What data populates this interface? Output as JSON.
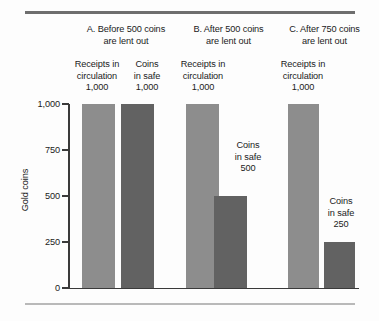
{
  "figure": {
    "y_axis_title": "Gold coins",
    "y_ticks": [
      "1,000",
      "750",
      "500",
      "250",
      "0"
    ]
  },
  "groups": [
    {
      "title_line1": "A. Before 500 coins",
      "title_line2": "are lent out",
      "bars": [
        {
          "label_line1": "Receipts in",
          "label_line2": "circulation",
          "value_label": "1,000",
          "value": 1000,
          "series": "receipts"
        },
        {
          "label_line1": "Coins",
          "label_line2": "in safe",
          "value_label": "1,000",
          "value": 1000,
          "series": "coins"
        }
      ]
    },
    {
      "title_line1": "B. After 500 coins",
      "title_line2": "are lent out",
      "bars": [
        {
          "label_line1": "Receipts in",
          "label_line2": "circulation",
          "value_label": "1,000",
          "value": 1000,
          "series": "receipts"
        },
        {
          "label_line1": "Coins",
          "label_line2": "in safe",
          "value_label": "500",
          "value": 500,
          "series": "coins"
        }
      ]
    },
    {
      "title_line1": "C. After 750 coins",
      "title_line2": "are lent out",
      "bars": [
        {
          "label_line1": "Receipts in",
          "label_line2": "circulation",
          "value_label": "1,000",
          "value": 1000,
          "series": "receipts"
        },
        {
          "label_line1": "Coins",
          "label_line2": "in safe",
          "value_label": "250",
          "value": 250,
          "series": "coins"
        }
      ]
    }
  ],
  "colors": {
    "receipts_bar": "#8d8d8d",
    "coins_bar": "#626262",
    "axis": "#3a3a3a",
    "rule_top": "#6e6e6e",
    "rule_bottom": "#b9b9b9",
    "background": "#fdfdfd",
    "text": "#1b1b1b"
  },
  "chart_data": {
    "type": "bar",
    "title": "",
    "xlabel": "",
    "ylabel": "Gold coins",
    "ylim": [
      0,
      1000
    ],
    "yticks": [
      0,
      250,
      500,
      750,
      1000
    ],
    "ytick_labels": [
      "0",
      "250",
      "500",
      "750",
      "1,000"
    ],
    "grid": false,
    "legend": "none",
    "panels": [
      {
        "name": "A. Before 500 coins are lent out",
        "categories": [
          "Receipts in circulation",
          "Coins in safe"
        ],
        "values": [
          1000,
          1000
        ],
        "data_labels": [
          "1,000",
          "1,000"
        ]
      },
      {
        "name": "B. After 500 coins are lent out",
        "categories": [
          "Receipts in circulation",
          "Coins in safe"
        ],
        "values": [
          1000,
          500
        ],
        "data_labels": [
          "1,000",
          "500"
        ]
      },
      {
        "name": "C. After 750 coins are lent out",
        "categories": [
          "Receipts in circulation",
          "Coins in safe"
        ],
        "values": [
          1000,
          250
        ],
        "data_labels": [
          "1,000",
          "250"
        ]
      }
    ],
    "series": [
      {
        "name": "Receipts in circulation",
        "values": [
          1000,
          1000,
          1000
        ],
        "color": "#8d8d8d"
      },
      {
        "name": "Coins in safe",
        "values": [
          1000,
          500,
          250
        ],
        "color": "#626262"
      }
    ],
    "x": [
      "A. Before 500 coins are lent out",
      "B. After 500 coins are lent out",
      "C. After 750 coins are lent out"
    ]
  }
}
